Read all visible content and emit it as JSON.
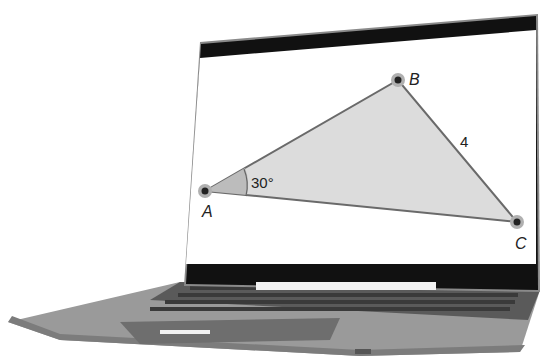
{
  "scene": {
    "device": "laptop",
    "description": "Laptop displaying triangle ABC"
  },
  "diagram": {
    "vertices": [
      {
        "name": "A",
        "x": 205,
        "y": 191
      },
      {
        "name": "B",
        "x": 398,
        "y": 80
      },
      {
        "name": "C",
        "x": 517,
        "y": 222
      }
    ],
    "angle_label": "30°",
    "side_label": "4",
    "labels": {
      "A": "A",
      "B": "B",
      "C": "C"
    },
    "fill_color": "#d9d9d9",
    "stroke_color": "#6a6a6a"
  }
}
